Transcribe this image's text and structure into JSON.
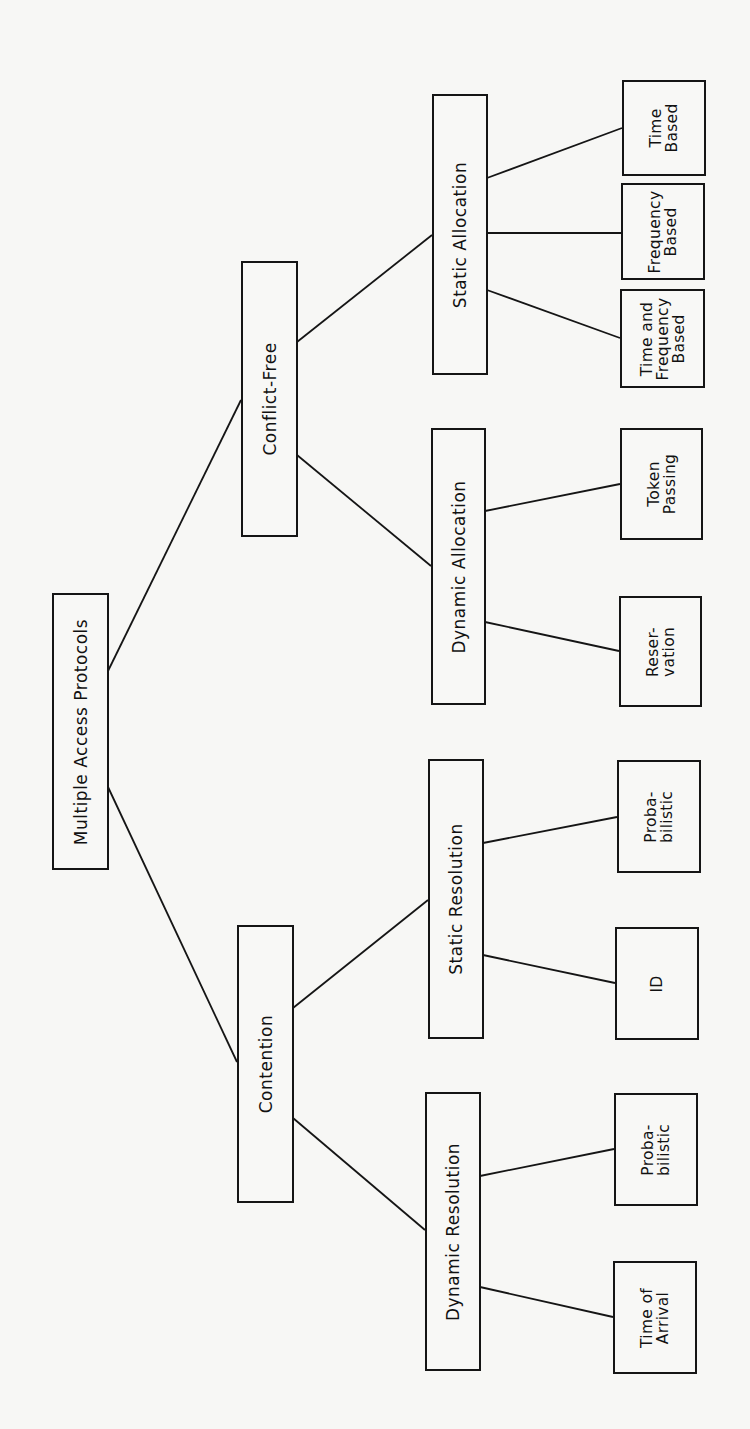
{
  "diagram": {
    "title": "Multiple Access Protocols",
    "orientation": "rotated 90° counter-clockwise (root on left, leaves on right)",
    "nodes": [
      {
        "id": "root",
        "label": "Multiple Access Protocols",
        "x": 52,
        "y": 593,
        "w": 57,
        "h": 277
      },
      {
        "id": "conflict_free",
        "label": "Conflict-Free",
        "x": 241,
        "y": 261,
        "w": 57,
        "h": 276
      },
      {
        "id": "contention",
        "label": "Contention",
        "x": 237,
        "y": 925,
        "w": 57,
        "h": 278
      },
      {
        "id": "static_allocation",
        "label": "Static Allocation",
        "x": 432,
        "y": 94,
        "w": 56,
        "h": 281
      },
      {
        "id": "dynamic_allocation",
        "label": "Dynamic Allocation",
        "x": 431,
        "y": 428,
        "w": 55,
        "h": 277
      },
      {
        "id": "static_resolution",
        "label": "Static Resolution",
        "x": 428,
        "y": 759,
        "w": 56,
        "h": 280
      },
      {
        "id": "dynamic_resolution",
        "label": "Dynamic Resolution",
        "x": 425,
        "y": 1092,
        "w": 56,
        "h": 279
      },
      {
        "id": "time_based",
        "label": "Time\nBased",
        "x": 622,
        "y": 80,
        "w": 84,
        "h": 96
      },
      {
        "id": "frequency_based",
        "label": "Frequency\nBased",
        "x": 621,
        "y": 183,
        "w": 84,
        "h": 97
      },
      {
        "id": "time_and_frequency_based",
        "label": "Time and\nFrequency\nBased",
        "x": 620,
        "y": 289,
        "w": 85,
        "h": 99
      },
      {
        "id": "token_passing",
        "label": "Token\nPassing",
        "x": 620,
        "y": 428,
        "w": 83,
        "h": 112
      },
      {
        "id": "reservation",
        "label": "Reser-\nvation",
        "x": 619,
        "y": 596,
        "w": 83,
        "h": 111
      },
      {
        "id": "probabilistic_static",
        "label": "Proba-\nbilistic",
        "x": 617,
        "y": 760,
        "w": 84,
        "h": 113
      },
      {
        "id": "id",
        "label": "ID",
        "x": 615,
        "y": 927,
        "w": 84,
        "h": 113
      },
      {
        "id": "probabilistic_dynamic",
        "label": "Proba-\nbilistic",
        "x": 614,
        "y": 1093,
        "w": 84,
        "h": 113
      },
      {
        "id": "time_of_arrival",
        "label": "Time of\nArrival",
        "x": 613,
        "y": 1261,
        "w": 84,
        "h": 113
      }
    ],
    "edges": [
      {
        "from": "root",
        "to": "conflict_free",
        "x1": 108,
        "y1": 671,
        "x2": 241,
        "y2": 400
      },
      {
        "from": "root",
        "to": "contention",
        "x1": 108,
        "y1": 787,
        "x2": 237,
        "y2": 1062
      },
      {
        "from": "conflict_free",
        "to": "static_allocation",
        "x1": 297,
        "y1": 342,
        "x2": 432,
        "y2": 235
      },
      {
        "from": "conflict_free",
        "to": "dynamic_allocation",
        "x1": 297,
        "y1": 455,
        "x2": 431,
        "y2": 566
      },
      {
        "from": "contention",
        "to": "static_resolution",
        "x1": 293,
        "y1": 1008,
        "x2": 428,
        "y2": 900
      },
      {
        "from": "contention",
        "to": "dynamic_resolution",
        "x1": 293,
        "y1": 1118,
        "x2": 425,
        "y2": 1230
      },
      {
        "from": "static_allocation",
        "to": "time_based",
        "x1": 487,
        "y1": 178,
        "x2": 622,
        "y2": 128
      },
      {
        "from": "static_allocation",
        "to": "frequency_based",
        "x1": 487,
        "y1": 233,
        "x2": 621,
        "y2": 233
      },
      {
        "from": "static_allocation",
        "to": "time_and_frequency_based",
        "x1": 487,
        "y1": 290,
        "x2": 620,
        "y2": 338
      },
      {
        "from": "dynamic_allocation",
        "to": "token_passing",
        "x1": 485,
        "y1": 511,
        "x2": 620,
        "y2": 484
      },
      {
        "from": "dynamic_allocation",
        "to": "reservation",
        "x1": 485,
        "y1": 622,
        "x2": 619,
        "y2": 651
      },
      {
        "from": "static_resolution",
        "to": "probabilistic_static",
        "x1": 483,
        "y1": 843,
        "x2": 617,
        "y2": 817
      },
      {
        "from": "static_resolution",
        "to": "id",
        "x1": 483,
        "y1": 955,
        "x2": 615,
        "y2": 983
      },
      {
        "from": "dynamic_resolution",
        "to": "probabilistic_dynamic",
        "x1": 480,
        "y1": 1176,
        "x2": 614,
        "y2": 1149
      },
      {
        "from": "dynamic_resolution",
        "to": "time_of_arrival",
        "x1": 480,
        "y1": 1287,
        "x2": 613,
        "y2": 1317
      }
    ]
  }
}
